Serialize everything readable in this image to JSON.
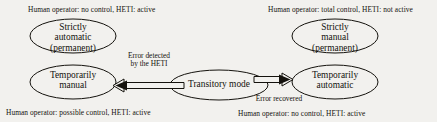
{
  "diagram": {
    "background_color": "#f2f1ee",
    "stroke_color": "#14120d",
    "captions": {
      "top_left": "Human operator: no control, HETI: active",
      "top_right": "Human operator: total control, HETI: not active",
      "bottom_left": "Human operator: possible control, HETI: active",
      "bottom_right": "Human operator: no control, HETI: active"
    },
    "nodes": [
      {
        "id": "strictly-automatic",
        "line1": "Strictly",
        "line2": "automatic",
        "line3": "(permanent)"
      },
      {
        "id": "temporarily-manual",
        "line1": "Temporarily",
        "line2": "manual",
        "line3": ""
      },
      {
        "id": "strictly-manual",
        "line1": "Strictly",
        "line2": "manual",
        "line3": "(permanent)"
      },
      {
        "id": "temporarily-automatic",
        "line1": "Temporarily",
        "line2": "automatic",
        "line3": ""
      },
      {
        "id": "transitory-mode",
        "line1": "Transitory mode",
        "line2": "",
        "line3": ""
      }
    ],
    "edges": [
      {
        "id": "error-detected",
        "line1": "Error detected",
        "line2": "by the HETI",
        "direction": "left"
      },
      {
        "id": "error-recovered",
        "line1": "Error recovered",
        "line2": "",
        "direction": "right"
      }
    ]
  }
}
